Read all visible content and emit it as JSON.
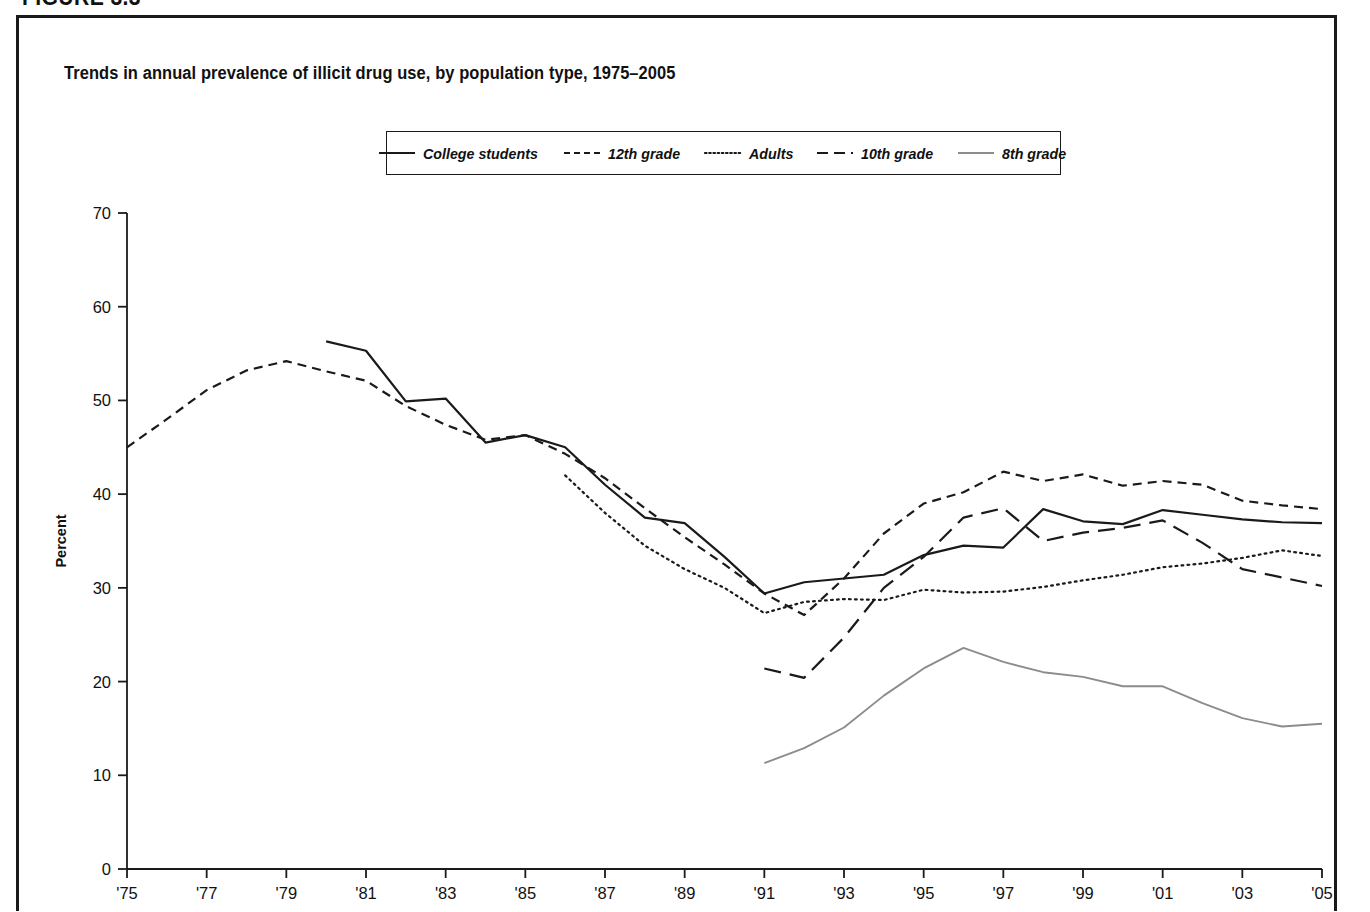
{
  "figure": {
    "heading": "FIGURE 3.3",
    "title": "Trends in annual prevalence of illicit drug use, by population type, 1975–2005"
  },
  "legend": {
    "items": [
      {
        "label": "College students",
        "style": "solid",
        "color": "#1a1a1a"
      },
      {
        "label": "12th grade",
        "style": "short-dash",
        "color": "#1a1a1a"
      },
      {
        "label": "Adults",
        "style": "dotted",
        "color": "#1a1a1a"
      },
      {
        "label": "10th grade",
        "style": "long-dash",
        "color": "#1a1a1a"
      },
      {
        "label": "8th grade",
        "style": "solid-gray",
        "color": "#8c8c8c"
      }
    ]
  },
  "axes": {
    "y_title": "Percent",
    "y_ticks": [
      "0",
      "10",
      "20",
      "30",
      "40",
      "50",
      "60",
      "70"
    ],
    "x_ticks": [
      "'75",
      "'77",
      "'79",
      "'81",
      "'83",
      "'85",
      "'87",
      "'89",
      "'91",
      "'93",
      "'95",
      "'97",
      "'99",
      "'01",
      "'03",
      "'05"
    ]
  },
  "chart_data": {
    "type": "line",
    "title": "Trends in annual prevalence of illicit drug use, by population type, 1975–2005",
    "xlabel": "",
    "ylabel": "Percent",
    "ylim": [
      0,
      70
    ],
    "xlim": [
      1975,
      2005
    ],
    "ytick_step": 10,
    "grid": false,
    "legend_position": "top-center",
    "x": [
      1975,
      1976,
      1977,
      1978,
      1979,
      1980,
      1981,
      1982,
      1983,
      1984,
      1985,
      1986,
      1987,
      1988,
      1989,
      1990,
      1991,
      1992,
      1993,
      1994,
      1995,
      1996,
      1997,
      1998,
      1999,
      2000,
      2001,
      2002,
      2003,
      2004,
      2005
    ],
    "series": [
      {
        "name": "College students",
        "style": "solid",
        "color": "#1a1a1a",
        "start_year": 1980,
        "values": [
          null,
          null,
          null,
          null,
          null,
          56.3,
          55.3,
          49.9,
          50.2,
          45.5,
          46.3,
          45.0,
          41.0,
          37.5,
          36.9,
          33.3,
          29.4,
          30.6,
          31.0,
          31.4,
          33.5,
          34.5,
          34.3,
          38.4,
          37.1,
          36.8,
          38.3,
          37.8,
          37.3,
          37.0,
          36.9
        ]
      },
      {
        "name": "12th grade",
        "style": "short-dash",
        "color": "#1a1a1a",
        "start_year": 1975,
        "values": [
          45.0,
          48.0,
          51.1,
          53.2,
          54.2,
          53.1,
          52.1,
          49.4,
          47.4,
          45.8,
          46.3,
          44.3,
          41.7,
          38.5,
          35.4,
          32.5,
          29.4,
          27.1,
          31.0,
          35.8,
          39.0,
          40.2,
          42.4,
          41.4,
          42.1,
          40.9,
          41.4,
          41.0,
          39.3,
          38.8,
          38.4
        ]
      },
      {
        "name": "Adults",
        "style": "dotted",
        "color": "#1a1a1a",
        "start_year": 1986,
        "values": [
          null,
          null,
          null,
          null,
          null,
          null,
          null,
          null,
          null,
          null,
          null,
          42.0,
          38.0,
          34.5,
          32.0,
          30.0,
          27.3,
          28.5,
          28.8,
          28.7,
          29.8,
          29.5,
          29.6,
          30.1,
          30.8,
          31.4,
          32.2,
          32.6,
          33.2,
          34.0,
          33.4
        ]
      },
      {
        "name": "10th grade",
        "style": "long-dash",
        "color": "#1a1a1a",
        "start_year": 1991,
        "values": [
          null,
          null,
          null,
          null,
          null,
          null,
          null,
          null,
          null,
          null,
          null,
          null,
          null,
          null,
          null,
          null,
          21.4,
          20.4,
          24.7,
          30.0,
          33.3,
          37.5,
          38.5,
          35.0,
          35.9,
          36.4,
          37.2,
          34.8,
          32.0,
          31.1,
          30.2
        ]
      },
      {
        "name": "8th grade",
        "style": "solid-gray",
        "color": "#8c8c8c",
        "start_year": 1991,
        "values": [
          null,
          null,
          null,
          null,
          null,
          null,
          null,
          null,
          null,
          null,
          null,
          null,
          null,
          null,
          null,
          null,
          11.3,
          12.9,
          15.1,
          18.5,
          21.4,
          23.6,
          22.1,
          21.0,
          20.5,
          19.5,
          19.5,
          17.7,
          16.1,
          15.2,
          15.5
        ]
      }
    ]
  }
}
